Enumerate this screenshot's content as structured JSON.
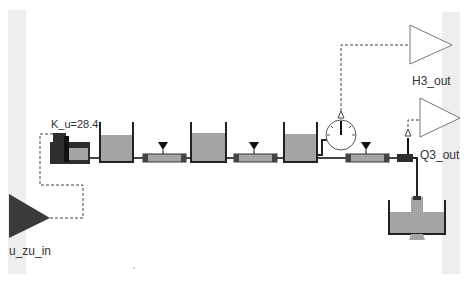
{
  "diagram": {
    "title": "",
    "blocks": {
      "input": {
        "label": "u_zu_in",
        "type": "inport"
      },
      "pump": {
        "label": "K_u=28.4",
        "type": "pump"
      },
      "tanks": [
        {
          "id": "tank1",
          "fill_level": 0.6
        },
        {
          "id": "tank2",
          "fill_level": 0.75
        },
        {
          "id": "tank3",
          "fill_level": 0.75
        }
      ],
      "valves": [
        {
          "id": "valve1"
        },
        {
          "id": "valve2"
        },
        {
          "id": "valve3"
        }
      ],
      "gauge": {
        "type": "level-gauge"
      },
      "sensor": {
        "type": "flow-sensor"
      },
      "outputs": [
        {
          "label": "H3_out",
          "type": "outport"
        },
        {
          "label": "Q3_out",
          "type": "outport"
        }
      ],
      "sink_tank": {
        "fill_level": 0.65
      }
    },
    "colors": {
      "fluid": "#a8a8a8",
      "wall": "#222222",
      "pipe": "#555555",
      "input_fill": "#3a3a3a",
      "output_stroke": "#777777"
    }
  }
}
